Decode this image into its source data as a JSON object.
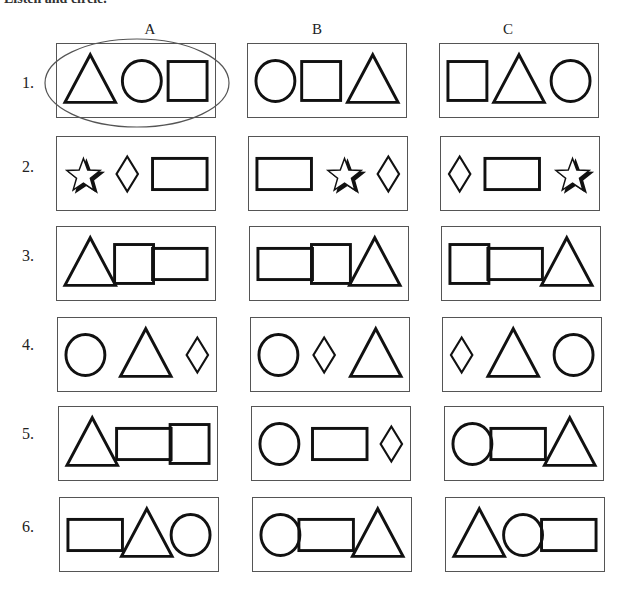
{
  "instruction": "Listen and circle.",
  "columns": [
    {
      "label": "A",
      "x": 150
    },
    {
      "label": "B",
      "x": 317
    },
    {
      "label": "C",
      "x": 508
    }
  ],
  "rows": [
    {
      "label": "1.",
      "y": 43,
      "label_y": 84,
      "boxes": [
        {
          "x": 56,
          "shapes": [
            "triangle",
            "circle",
            "square"
          ],
          "circled": true
        },
        {
          "x": 247,
          "shapes": [
            "circle",
            "square",
            "triangle"
          ],
          "circled": false
        },
        {
          "x": 439,
          "shapes": [
            "square",
            "triangle",
            "circle"
          ],
          "circled": false
        }
      ]
    },
    {
      "label": "2.",
      "y": 136,
      "label_y": 168,
      "boxes": [
        {
          "x": 56,
          "shapes": [
            "star",
            "diamond",
            "rectangle"
          ],
          "circled": false
        },
        {
          "x": 248,
          "shapes": [
            "rectangle",
            "star",
            "diamond"
          ],
          "circled": false
        },
        {
          "x": 440,
          "shapes": [
            "diamond",
            "rectangle",
            "star"
          ],
          "circled": false
        }
      ]
    },
    {
      "label": "3.",
      "y": 226,
      "label_y": 257,
      "boxes": [
        {
          "x": 56,
          "shapes": [
            "triangle",
            "square",
            "rectangle"
          ],
          "circled": false
        },
        {
          "x": 249,
          "shapes": [
            "rectangle",
            "square",
            "triangle"
          ],
          "circled": false
        },
        {
          "x": 441,
          "shapes": [
            "square",
            "rectangle",
            "triangle"
          ],
          "circled": false
        }
      ]
    },
    {
      "label": "4.",
      "y": 317,
      "label_y": 346,
      "boxes": [
        {
          "x": 57,
          "shapes": [
            "circle",
            "triangle",
            "diamond"
          ],
          "circled": false
        },
        {
          "x": 250,
          "shapes": [
            "circle",
            "diamond",
            "triangle"
          ],
          "circled": false
        },
        {
          "x": 442,
          "shapes": [
            "diamond",
            "triangle",
            "circle"
          ],
          "circled": false
        }
      ]
    },
    {
      "label": "5.",
      "y": 406,
      "label_y": 435,
      "boxes": [
        {
          "x": 58,
          "shapes": [
            "triangle",
            "rectangle",
            "square"
          ],
          "circled": false
        },
        {
          "x": 251,
          "shapes": [
            "circle",
            "rectangle",
            "diamond"
          ],
          "circled": false
        },
        {
          "x": 444,
          "shapes": [
            "circle",
            "rectangle",
            "triangle"
          ],
          "circled": false
        }
      ]
    },
    {
      "label": "6.",
      "y": 497,
      "label_y": 528,
      "boxes": [
        {
          "x": 59,
          "shapes": [
            "rectangle",
            "triangle",
            "circle"
          ],
          "circled": false
        },
        {
          "x": 252,
          "shapes": [
            "circle",
            "rectangle",
            "triangle"
          ],
          "circled": false
        },
        {
          "x": 445,
          "shapes": [
            "triangle",
            "circle",
            "rectangle"
          ],
          "circled": false
        }
      ]
    }
  ],
  "colors": {
    "stroke": "#111111",
    "box_border": "#555555",
    "ellipse": "#555555"
  }
}
